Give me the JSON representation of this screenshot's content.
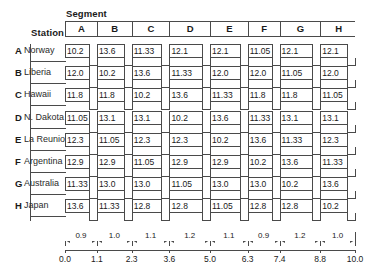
{
  "figure": {
    "segment_caption": "Segment",
    "station_caption": "Station",
    "segment_headers": [
      "A",
      "B",
      "C",
      "D",
      "E",
      "F",
      "G",
      "H"
    ],
    "stations": [
      {
        "letter": "A",
        "name": "Norway"
      },
      {
        "letter": "B",
        "name": "Liberia"
      },
      {
        "letter": "C",
        "name": "Hawaii"
      },
      {
        "letter": "D",
        "name": "N. Dakota"
      },
      {
        "letter": "E",
        "name": "La Reunion"
      },
      {
        "letter": "F",
        "name": "Argentina"
      },
      {
        "letter": "G",
        "name": "Australia"
      },
      {
        "letter": "H",
        "name": "Japan"
      }
    ],
    "axis": {
      "tick_labels": [
        "0.0",
        "1.1",
        "2.3",
        "3.6",
        "5.0",
        "6.3",
        "7.4",
        "8.8",
        "10.0"
      ],
      "tick_values": [
        0.0,
        1.1,
        2.3,
        3.6,
        5.0,
        6.3,
        7.4,
        8.8,
        10.0
      ],
      "range": [
        0.0,
        10.0
      ]
    },
    "segment_widths": [
      "0.9",
      "1.0",
      "1.1",
      "1.2",
      "1.1",
      "0.9",
      "1.2",
      "1.0"
    ]
  },
  "chart_data": {
    "type": "table",
    "title": "",
    "xlabel": "Segment",
    "ylabel": "Station",
    "categories": [
      "A",
      "B",
      "C",
      "D",
      "E",
      "F",
      "G",
      "H"
    ],
    "row_labels": [
      "A Norway",
      "B Liberia",
      "C Hawaii",
      "D N. Dakota",
      "E La Reunion",
      "F Argentina",
      "G Australia",
      "H Japan"
    ],
    "axis_ticks": [
      0.0,
      1.1,
      2.3,
      3.6,
      5.0,
      6.3,
      7.4,
      8.8,
      10.0
    ],
    "segment_widths": [
      0.9,
      1.0,
      1.1,
      1.2,
      1.1,
      0.9,
      1.2,
      1.0
    ],
    "grid": false,
    "legend": "none",
    "series": [
      {
        "name": "A Norway",
        "values": [
          "10.2",
          "13.6",
          "11.33",
          "12.1",
          "12.1",
          "11.05",
          "12.1",
          "12.1"
        ]
      },
      {
        "name": "B Liberia",
        "values": [
          "12.0",
          "10.2",
          "13.6",
          "11.33",
          "12.0",
          "12.0",
          "11.05",
          "12.0"
        ]
      },
      {
        "name": "C Hawaii",
        "values": [
          "11.8",
          "11.8",
          "10.2",
          "13.6",
          "11.33",
          "11.8",
          "11.8",
          "11.05"
        ]
      },
      {
        "name": "D N. Dakota",
        "values": [
          "11.05",
          "13.1",
          "13.1",
          "10.2",
          "13.6",
          "11.33",
          "13.1",
          "13.1"
        ]
      },
      {
        "name": "E La Reunion",
        "values": [
          "12.3",
          "11.05",
          "12.3",
          "12.3",
          "10.2",
          "13.6",
          "11.33",
          "12.3"
        ]
      },
      {
        "name": "F Argentina",
        "values": [
          "12.9",
          "12.9",
          "11.05",
          "12.9",
          "12.9",
          "10.2",
          "13.6",
          "11.33"
        ]
      },
      {
        "name": "G Australia",
        "values": [
          "11.33",
          "13.0",
          "13.0",
          "11.05",
          "13.0",
          "13.0",
          "10.2",
          "13.6"
        ]
      },
      {
        "name": "H Japan",
        "values": [
          "13.6",
          "11.33",
          "12.8",
          "12.8",
          "11.05",
          "12.8",
          "12.8",
          "10.2"
        ]
      }
    ]
  }
}
